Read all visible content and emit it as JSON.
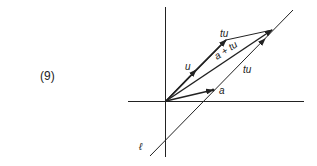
{
  "equation_number": "(9)",
  "labels": {
    "u": "u",
    "tu_top": "tu",
    "a_plus_tu": "a + tu",
    "tu_line": "tu",
    "a": "a",
    "line": "ℓ"
  },
  "colors": {
    "ink": "#222222",
    "background": "#ffffff"
  }
}
